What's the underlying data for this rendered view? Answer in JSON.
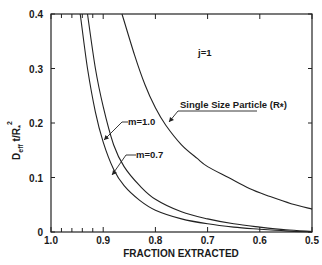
{
  "chart_data": {
    "type": "line",
    "title": "",
    "xlabel": "FRACTION EXTRACTED",
    "ylabel": "D_eff t / R*^2",
    "ylabel_parts": {
      "main": "D",
      "sub": "eff",
      "mid": " t/R",
      "star": "*",
      "sup": "2"
    },
    "xlim": [
      1.0,
      0.5
    ],
    "ylim": [
      0,
      0.4
    ],
    "x_reversed": true,
    "grid": false,
    "x_ticks": [
      {
        "value": 1.0,
        "label": "1.0"
      },
      {
        "value": 0.9,
        "label": "0.9"
      },
      {
        "value": 0.8,
        "label": "0.8"
      },
      {
        "value": 0.7,
        "label": "0.7"
      },
      {
        "value": 0.6,
        "label": "0.6"
      },
      {
        "value": 0.5,
        "label": "0.5"
      }
    ],
    "x_minor_ticks": [
      0.98,
      0.96,
      0.94,
      0.92
    ],
    "y_ticks": [
      {
        "value": 0,
        "label": "0"
      },
      {
        "value": 0.1,
        "label": "0.1"
      },
      {
        "value": 0.2,
        "label": "0.2"
      },
      {
        "value": 0.3,
        "label": "0.3"
      },
      {
        "value": 0.4,
        "label": "0.4"
      }
    ],
    "annotation_j": "j=1",
    "series": [
      {
        "name": "m=0.7",
        "label": "m=0.7",
        "x": [
          0.944,
          0.93,
          0.915,
          0.9,
          0.88,
          0.86,
          0.83,
          0.8,
          0.75,
          0.7,
          0.65,
          0.6,
          0.55,
          0.5
        ],
        "y": [
          0.4,
          0.3,
          0.22,
          0.165,
          0.115,
          0.085,
          0.058,
          0.04,
          0.024,
          0.015,
          0.009,
          0.005,
          0.002,
          0.0
        ]
      },
      {
        "name": "m=1.0",
        "label": "m=1.0",
        "x": [
          0.93,
          0.915,
          0.9,
          0.88,
          0.86,
          0.83,
          0.8,
          0.75,
          0.7,
          0.65,
          0.6,
          0.55,
          0.5
        ],
        "y": [
          0.4,
          0.3,
          0.23,
          0.16,
          0.12,
          0.085,
          0.06,
          0.037,
          0.024,
          0.015,
          0.009,
          0.004,
          0.001
        ]
      },
      {
        "name": "Single Size Particle",
        "label": "Single Size Particle (R*)",
        "x": [
          0.864,
          0.84,
          0.82,
          0.8,
          0.78,
          0.75,
          0.72,
          0.7,
          0.66,
          0.62,
          0.58,
          0.54,
          0.5
        ],
        "y": [
          0.4,
          0.325,
          0.27,
          0.228,
          0.196,
          0.16,
          0.135,
          0.12,
          0.1,
          0.08,
          0.065,
          0.052,
          0.042
        ]
      }
    ],
    "series_labels": [
      {
        "text": "m=1.0",
        "series": "m=1.0"
      },
      {
        "text": "m=0.7",
        "series": "m=0.7"
      },
      {
        "text": "Single Size Particle (R",
        "star": "*",
        "close": ")",
        "series": "Single Size Particle"
      }
    ]
  }
}
